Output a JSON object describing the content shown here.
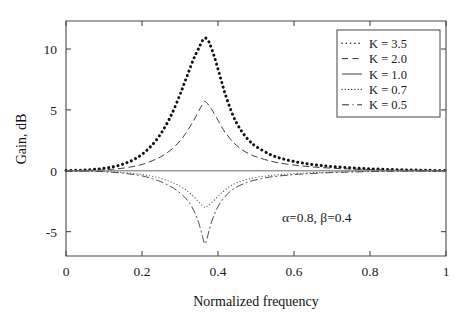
{
  "chart_data": {
    "type": "line",
    "title": "",
    "xlabel": "Normalized frequency",
    "ylabel": "Gain, dB",
    "xlim": [
      0,
      1
    ],
    "ylim": [
      -7.0,
      12.3
    ],
    "grid": false,
    "xticks": [
      0,
      0.2,
      0.4,
      0.6,
      0.8,
      1
    ],
    "xtick_labels": [
      "0",
      "0.2",
      "0.4",
      "0.6",
      "0.8",
      "1"
    ],
    "yticks": [
      10,
      5,
      0,
      -5
    ],
    "ytick_labels": [
      "10",
      "5",
      "0",
      "-5"
    ],
    "legend_position": "upper right",
    "annotations": [
      {
        "text": "α=0.8, β=0.4",
        "x": 0.66,
        "y": -4.2
      }
    ],
    "parameters": {
      "alpha": 0.8,
      "beta": 0.4,
      "center_frequency": 0.365
    },
    "series": [
      {
        "name": "K = 3.5",
        "K": 3.5,
        "style": "dotted",
        "width": 3.0,
        "color": "#111111",
        "peak_value": 10.9,
        "peak_x": 0.365,
        "x": [
          0,
          0.02,
          0.04,
          0.06,
          0.08,
          0.1,
          0.12,
          0.14,
          0.16,
          0.18,
          0.2,
          0.22,
          0.24,
          0.26,
          0.28,
          0.3,
          0.31,
          0.32,
          0.33,
          0.34,
          0.35,
          0.355,
          0.36,
          0.365,
          0.37,
          0.375,
          0.38,
          0.39,
          0.4,
          0.41,
          0.42,
          0.44,
          0.46,
          0.48,
          0.5,
          0.54,
          0.58,
          0.62,
          0.66,
          0.7,
          0.75,
          0.8,
          0.85,
          0.9,
          0.95,
          1
        ],
        "y": [
          0.02,
          0.03,
          0.05,
          0.08,
          0.13,
          0.2,
          0.3,
          0.45,
          0.66,
          0.95,
          1.35,
          1.9,
          2.62,
          3.57,
          4.77,
          6.25,
          7.07,
          7.9,
          8.72,
          9.48,
          10.1,
          10.45,
          10.72,
          10.9,
          10.85,
          10.65,
          10.3,
          9.4,
          8.35,
          7.25,
          6.2,
          4.5,
          3.35,
          2.55,
          2.0,
          1.3,
          0.9,
          0.65,
          0.47,
          0.35,
          0.24,
          0.16,
          0.11,
          0.07,
          0.04,
          0.02
        ]
      },
      {
        "name": "K = 2.0",
        "K": 2.0,
        "style": "dashed",
        "width": 1.0,
        "color": "#3a3a3a",
        "peak_value": 5.7,
        "peak_x": 0.365,
        "x": [
          0,
          0.04,
          0.08,
          0.12,
          0.16,
          0.2,
          0.24,
          0.26,
          0.28,
          0.3,
          0.31,
          0.32,
          0.33,
          0.34,
          0.35,
          0.36,
          0.365,
          0.37,
          0.38,
          0.39,
          0.4,
          0.41,
          0.42,
          0.44,
          0.46,
          0.48,
          0.5,
          0.54,
          0.58,
          0.62,
          0.66,
          0.72,
          0.78,
          0.85,
          0.92,
          1
        ],
        "y": [
          0.01,
          0.02,
          0.05,
          0.12,
          0.26,
          0.52,
          1.0,
          1.35,
          1.82,
          2.45,
          2.85,
          3.3,
          3.82,
          4.35,
          4.95,
          5.5,
          5.7,
          5.6,
          5.2,
          4.7,
          4.15,
          3.6,
          3.1,
          2.35,
          1.8,
          1.42,
          1.15,
          0.78,
          0.55,
          0.4,
          0.29,
          0.18,
          0.11,
          0.06,
          0.03,
          0.01
        ]
      },
      {
        "name": "K = 1.0",
        "K": 1.0,
        "style": "solid",
        "width": 0.9,
        "color": "#8d8d8d",
        "peak_value": 0,
        "peak_x": 0.365,
        "x": [
          0,
          0.25,
          0.5,
          0.75,
          1
        ],
        "y": [
          0,
          0,
          0,
          0,
          0
        ]
      },
      {
        "name": "K = 0.7",
        "K": 0.7,
        "style": "dotted",
        "width": 1.2,
        "color": "#5a5a5a",
        "peak_value": -3.0,
        "peak_x": 0.365,
        "x": [
          0,
          0.05,
          0.1,
          0.15,
          0.2,
          0.24,
          0.27,
          0.29,
          0.31,
          0.32,
          0.33,
          0.34,
          0.35,
          0.36,
          0.365,
          0.37,
          0.38,
          0.39,
          0.4,
          0.41,
          0.43,
          0.45,
          0.48,
          0.52,
          0.56,
          0.62,
          0.7,
          0.8,
          0.9,
          1
        ],
        "y": [
          -0.01,
          -0.02,
          -0.06,
          -0.14,
          -0.3,
          -0.55,
          -0.85,
          -1.1,
          -1.45,
          -1.68,
          -1.95,
          -2.25,
          -2.58,
          -2.9,
          -3.0,
          -2.95,
          -2.72,
          -2.42,
          -2.1,
          -1.8,
          -1.3,
          -0.98,
          -0.68,
          -0.45,
          -0.32,
          -0.2,
          -0.11,
          -0.05,
          -0.02,
          -0.01
        ]
      },
      {
        "name": "K = 0.5",
        "K": 0.5,
        "style": "dashdot",
        "width": 1.0,
        "color": "#4a4a4a",
        "peak_value": -6.0,
        "peak_x": 0.365,
        "x": [
          0,
          0.05,
          0.1,
          0.15,
          0.2,
          0.24,
          0.27,
          0.29,
          0.31,
          0.32,
          0.33,
          0.34,
          0.345,
          0.35,
          0.355,
          0.36,
          0.365,
          0.37,
          0.375,
          0.38,
          0.39,
          0.4,
          0.41,
          0.43,
          0.45,
          0.48,
          0.52,
          0.56,
          0.62,
          0.7,
          0.8,
          0.9,
          1
        ],
        "y": [
          -0.01,
          -0.03,
          -0.08,
          -0.2,
          -0.42,
          -0.78,
          -1.2,
          -1.58,
          -2.1,
          -2.45,
          -2.9,
          -3.5,
          -3.9,
          -4.35,
          -4.9,
          -5.5,
          -6.0,
          -5.7,
          -5.1,
          -4.5,
          -3.6,
          -2.95,
          -2.45,
          -1.75,
          -1.32,
          -0.92,
          -0.6,
          -0.43,
          -0.27,
          -0.15,
          -0.07,
          -0.03,
          -0.01
        ]
      }
    ]
  }
}
